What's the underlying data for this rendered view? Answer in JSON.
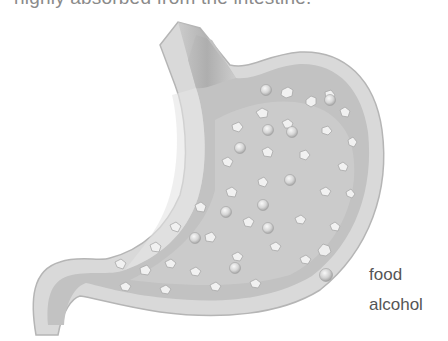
{
  "caption": {
    "text": "highly absorbed from the intestine."
  },
  "figure": {
    "contents": [
      "food particles (irregular flakes)",
      "alcohol (round spheres)"
    ]
  },
  "legend": {
    "items": [
      {
        "icon": "food-flake-icon",
        "label": ""
      },
      {
        "icon": "alcohol-sphere-icon",
        "label": "food"
      },
      {
        "icon": "",
        "label": "alcohol"
      }
    ]
  },
  "colors": {
    "wall": "#d4d4d4",
    "wall_edge": "#b8b8b8",
    "lumen": "#bdbdbd",
    "particle": "#eeeeee",
    "text": "#555555"
  }
}
